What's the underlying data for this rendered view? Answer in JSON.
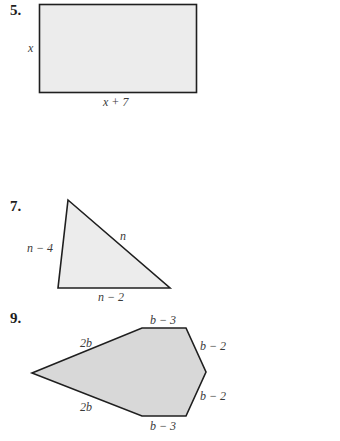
{
  "problems": [
    {
      "number": "5.",
      "shape": "rectangle",
      "fill": "#ececec",
      "stroke": "#1f1f1f",
      "labels": {
        "left": "x",
        "bottom": "x + 7"
      }
    },
    {
      "number": "7.",
      "shape": "triangle",
      "fill": "#ececec",
      "stroke": "#1f1f1f",
      "labels": {
        "left": "n − 4",
        "hypotenuse": "n",
        "bottom": "n − 2"
      }
    },
    {
      "number": "9.",
      "shape": "hexagon",
      "fill": "#d8d8d8",
      "stroke": "#1f1f1f",
      "labels": {
        "upper_left": "2b",
        "top": "b − 3",
        "upper_right": "b − 2",
        "lower_right": "b − 2",
        "bottom": "b − 3",
        "lower_left": "2b"
      }
    }
  ]
}
